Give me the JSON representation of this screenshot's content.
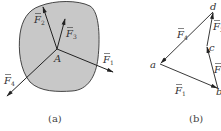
{
  "figure_a": {
    "caption": "(a)",
    "point_label": "A",
    "forces": [
      {
        "id": "F1",
        "label": "F",
        "sub": "1"
      },
      {
        "id": "F2",
        "label": "F",
        "sub": "2"
      },
      {
        "id": "F3",
        "label": "F",
        "sub": "3"
      },
      {
        "id": "F4",
        "label": "F",
        "sub": "4"
      }
    ]
  },
  "figure_b": {
    "caption": "(b)",
    "vertices": [
      "a",
      "b",
      "c",
      "d"
    ],
    "forces": [
      {
        "id": "F1",
        "label": "F",
        "sub": "1",
        "from": "a",
        "to": "b"
      },
      {
        "id": "F2",
        "label": "F",
        "sub": "2",
        "from": "b",
        "to": "c"
      },
      {
        "id": "F3",
        "label": "F",
        "sub": "3",
        "from": "c",
        "to": "d"
      },
      {
        "id": "F4",
        "label": "F",
        "sub": "4",
        "from": "d",
        "to": "a"
      }
    ]
  },
  "colors": {
    "body_fill": "#c8c8c8",
    "outline": "#333333",
    "arrow": "#222222"
  }
}
